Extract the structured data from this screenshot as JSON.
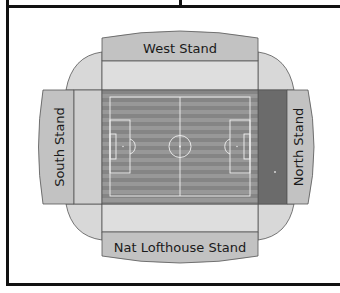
{
  "diagram": {
    "stands": {
      "west": {
        "label": "West Stand"
      },
      "south": {
        "label": "South Stand"
      },
      "north": {
        "label": "North Stand"
      },
      "east": {
        "label": "Nat Lofthouse Stand"
      }
    },
    "colors": {
      "stand_fill": "#c2c2c2",
      "concourse_fill": "#dedede",
      "corner_fill": "#d8d8d8",
      "north_inner_band": "#6b6b6b",
      "grass_dark": "#848484",
      "grass_light": "#979797",
      "pitch_lines": "#f2f2f2",
      "outline": "#4a4a4a",
      "frame": "#111111"
    }
  }
}
